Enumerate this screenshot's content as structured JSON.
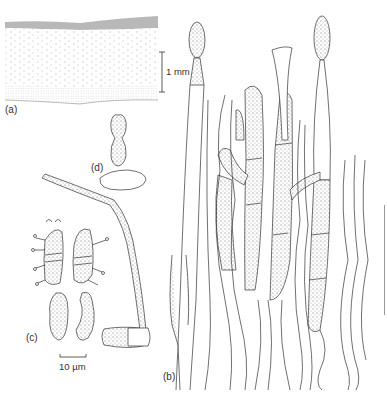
{
  "figure": {
    "panels": [
      {
        "id": "a",
        "label": "(a)",
        "description": "cross-section of tissue layer with hairy upper surface"
      },
      {
        "id": "b",
        "label": "(b)",
        "description": "bundle of hyphae with terminal stipitate cells"
      },
      {
        "id": "c",
        "label": "(c)",
        "description": "septate spores with appendages and non-septate spores"
      },
      {
        "id": "d",
        "label": "(d)",
        "description": "small stalked cell on basal cell"
      }
    ],
    "scale_bars": {
      "panel_a": "1 mm",
      "panel_c": "10 µm"
    }
  }
}
